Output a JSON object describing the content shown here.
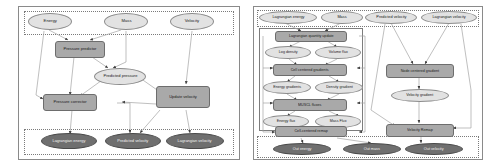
{
  "figure": {
    "type": "diagram",
    "subtype": "dataflow-graph",
    "panels": 2
  },
  "left_panel": {
    "name": "lagrangian-phase-graph",
    "input_cluster": {
      "name": "inputs",
      "nodes": [
        {
          "id": "energy",
          "label": "Energy",
          "shape": "ellipse",
          "kind": "data"
        },
        {
          "id": "mass",
          "label": "Mass",
          "shape": "ellipse",
          "kind": "data"
        },
        {
          "id": "velocity",
          "label": "Velocity",
          "shape": "ellipse",
          "kind": "data"
        }
      ]
    },
    "body_nodes": [
      {
        "id": "pressure_predictor",
        "label": "Pressure predictor",
        "shape": "box",
        "kind": "op"
      },
      {
        "id": "predicted_pressure",
        "label": "Predicted pressure",
        "shape": "ellipse",
        "kind": "data"
      },
      {
        "id": "pressure_corrector",
        "label": "Pressure corrector",
        "shape": "box",
        "kind": "op"
      },
      {
        "id": "update_velocity",
        "label": "Update velocity",
        "shape": "box",
        "kind": "op"
      }
    ],
    "output_cluster": {
      "name": "outputs",
      "nodes": [
        {
          "id": "lagrangian_energy",
          "label": "Lagrangian energy",
          "shape": "ellipse",
          "kind": "output"
        },
        {
          "id": "predicted_velocity",
          "label": "Predicted velocity",
          "shape": "ellipse",
          "kind": "output"
        },
        {
          "id": "lagrangian_velocity",
          "label": "Lagrangian velocity",
          "shape": "ellipse",
          "kind": "output"
        }
      ]
    }
  },
  "right_panel": {
    "name": "remap-phase-graph",
    "input_cluster": {
      "name": "inputs",
      "nodes": [
        {
          "id": "in_lagrangian_energy",
          "label": "Lagrangian energy",
          "shape": "ellipse",
          "kind": "data"
        },
        {
          "id": "in_mass",
          "label": "Mass",
          "shape": "ellipse",
          "kind": "data"
        },
        {
          "id": "in_predicted_velocity",
          "label": "Predicted velocity",
          "shape": "ellipse",
          "kind": "data"
        },
        {
          "id": "in_lagrangian_velocity",
          "label": "Lagrangian velocity",
          "shape": "ellipse",
          "kind": "data"
        }
      ]
    },
    "subgraph_nodes": [
      {
        "id": "lagrangian_quantity_update",
        "label": "Lagrangian quantity update",
        "shape": "box",
        "kind": "op"
      },
      {
        "id": "log_density",
        "label": "Log density",
        "shape": "ellipse",
        "kind": "data"
      },
      {
        "id": "volume_flux",
        "label": "Volume flux",
        "shape": "ellipse",
        "kind": "data"
      },
      {
        "id": "cell_centered_gradients",
        "label": "Cell centered gradients",
        "shape": "box",
        "kind": "op"
      },
      {
        "id": "energy_gradients",
        "label": "Energy gradients",
        "shape": "ellipse",
        "kind": "data"
      },
      {
        "id": "density_gradient",
        "label": "Density gradient",
        "shape": "ellipse",
        "kind": "data"
      },
      {
        "id": "muscl_fluxes",
        "label": "MUSCL fluxes",
        "shape": "box",
        "kind": "op"
      },
      {
        "id": "energy_flux",
        "label": "Energy flux",
        "shape": "ellipse",
        "kind": "data"
      },
      {
        "id": "mass_flux",
        "label": "Mass Flux",
        "shape": "ellipse",
        "kind": "data"
      },
      {
        "id": "cell_centered_remap",
        "label": "Cell-centered remap",
        "shape": "box",
        "kind": "op"
      }
    ],
    "velocity_branch_nodes": [
      {
        "id": "node_centered_gradient",
        "label": "Node centered gradient",
        "shape": "box",
        "kind": "op"
      },
      {
        "id": "velocity_gradient",
        "label": "Velocity gradient",
        "shape": "ellipse",
        "kind": "data"
      },
      {
        "id": "velocity_remap",
        "label": "Velocity Remap",
        "shape": "box",
        "kind": "op"
      }
    ],
    "output_cluster": {
      "name": "outputs",
      "nodes": [
        {
          "id": "out_energy",
          "label": "Out energy",
          "shape": "ellipse",
          "kind": "output"
        },
        {
          "id": "out_mass",
          "label": "Out mass",
          "shape": "ellipse",
          "kind": "output"
        },
        {
          "id": "out_velocity",
          "label": "Out velocity",
          "shape": "ellipse",
          "kind": "output"
        }
      ]
    }
  },
  "colors": {
    "op_fill": "#a9a9a9",
    "data_fill": "#e2e2e2",
    "output_fill": "#6f6f6f",
    "edge": "#9a9a9a",
    "edge_dark": "#555555",
    "cluster_border": "#7a7a7a",
    "background": "#ffffff"
  }
}
